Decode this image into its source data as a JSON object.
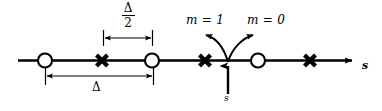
{
  "figure": {
    "type": "number-line-diagram",
    "title": "",
    "canvas": {
      "width": 382,
      "height": 111
    },
    "colors": {
      "ink": "#000000",
      "background": "#ffffff"
    }
  },
  "axis": {
    "label": "s",
    "label_italic": true,
    "orientation": "horizontal",
    "start_x": 18,
    "end_x": 358,
    "y": 60,
    "arrowhead": "right"
  },
  "markers": [
    {
      "id": "marker-1",
      "glyph": "circle",
      "x": 45,
      "meaning": "open-circle-sample"
    },
    {
      "id": "marker-2",
      "glyph": "cross",
      "x": 102,
      "meaning": "cross-sample"
    },
    {
      "id": "marker-3",
      "glyph": "circle",
      "x": 152,
      "meaning": "open-circle-sample"
    },
    {
      "id": "marker-4",
      "glyph": "cross",
      "x": 205,
      "meaning": "cross-sample"
    },
    {
      "id": "marker-5",
      "glyph": "circle",
      "x": 258,
      "meaning": "open-circle-sample"
    },
    {
      "id": "marker-6",
      "glyph": "cross",
      "x": 310,
      "meaning": "cross-sample"
    }
  ],
  "dimensions": [
    {
      "id": "half-delta",
      "label_numerator": "Δ",
      "label_denominator": "2",
      "label_kind": "fraction",
      "from_x": 103,
      "to_x": 152,
      "y": 38,
      "tick_top": 30,
      "tick_bottom": 46
    },
    {
      "id": "full-delta",
      "label": "Δ",
      "label_kind": "plain",
      "from_x": 45,
      "to_x": 153,
      "y": 76,
      "tick_top": 68,
      "tick_bottom": 85
    }
  ],
  "annotations": {
    "pointer": {
      "label": "s",
      "label_italic": true,
      "x": 228,
      "from_y": 96,
      "to_y": 64,
      "direction": "up"
    },
    "branches": [
      {
        "id": "branch-m1",
        "label": "m = 1",
        "direction": "left",
        "target_marker": "marker-4",
        "origin_x": 228,
        "origin_y": 62,
        "tip_x": 203,
        "tip_y": 40
      },
      {
        "id": "branch-m0",
        "label": "m = 0",
        "direction": "right",
        "target_marker": "marker-5",
        "origin_x": 228,
        "origin_y": 62,
        "tip_x": 256,
        "tip_y": 40
      }
    ]
  }
}
